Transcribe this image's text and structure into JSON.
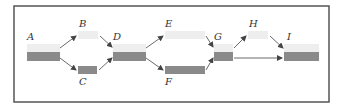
{
  "diagram": {
    "frame": {
      "x": 14,
      "y": 6,
      "w": 315,
      "h": 96,
      "stroke": "#555555"
    },
    "colors": {
      "light": "#eeeeee",
      "dark": "#8a8a8a",
      "arrow": "#444444"
    },
    "nodes": [
      {
        "id": "A",
        "label": "A",
        "x": 27,
        "w": 33,
        "level": "mid",
        "light": true,
        "dark": true,
        "lx": 27,
        "ly": 40
      },
      {
        "id": "B",
        "label": "B",
        "x": 78,
        "w": 20,
        "level": "top",
        "light": true,
        "dark": false,
        "lx": 79,
        "ly": 27
      },
      {
        "id": "C",
        "label": "C",
        "x": 78,
        "w": 19,
        "level": "bottom",
        "light": false,
        "dark": true,
        "lx": 79,
        "ly": 85
      },
      {
        "id": "D",
        "label": "D",
        "x": 113,
        "w": 33,
        "level": "mid",
        "light": true,
        "dark": true,
        "lx": 113,
        "ly": 40
      },
      {
        "id": "E",
        "label": "E",
        "x": 165,
        "w": 40,
        "level": "top",
        "light": true,
        "dark": false,
        "lx": 165,
        "ly": 27
      },
      {
        "id": "F",
        "label": "F",
        "x": 165,
        "w": 40,
        "level": "bottom",
        "light": false,
        "dark": true,
        "lx": 165,
        "ly": 85
      },
      {
        "id": "G",
        "label": "G",
        "x": 214,
        "w": 19,
        "level": "mid",
        "light": true,
        "dark": true,
        "lx": 214,
        "ly": 40
      },
      {
        "id": "H",
        "label": "H",
        "x": 248,
        "w": 20,
        "level": "top",
        "light": true,
        "dark": false,
        "lx": 249,
        "ly": 27
      },
      {
        "id": "I",
        "label": "I",
        "x": 284,
        "w": 35,
        "level": "mid",
        "light": true,
        "dark": true,
        "lx": 287,
        "ly": 40
      }
    ],
    "edges": [
      {
        "from": "A",
        "to": "B",
        "x1": 60,
        "y1": 48,
        "x2": 76,
        "y2": 36
      },
      {
        "from": "A",
        "to": "C",
        "x1": 60,
        "y1": 58,
        "x2": 76,
        "y2": 70
      },
      {
        "from": "B",
        "to": "D",
        "x1": 100,
        "y1": 36,
        "x2": 112,
        "y2": 47
      },
      {
        "from": "C",
        "to": "D",
        "x1": 99,
        "y1": 70,
        "x2": 112,
        "y2": 58
      },
      {
        "from": "D",
        "to": "E",
        "x1": 146,
        "y1": 48,
        "x2": 163,
        "y2": 36
      },
      {
        "from": "D",
        "to": "F",
        "x1": 146,
        "y1": 58,
        "x2": 163,
        "y2": 70
      },
      {
        "from": "E",
        "to": "G",
        "x1": 206,
        "y1": 36,
        "x2": 213,
        "y2": 47
      },
      {
        "from": "F",
        "to": "G",
        "x1": 206,
        "y1": 70,
        "x2": 213,
        "y2": 58
      },
      {
        "from": "G",
        "to": "H",
        "x1": 234,
        "y1": 48,
        "x2": 246,
        "y2": 36
      },
      {
        "from": "H",
        "to": "I",
        "x1": 270,
        "y1": 36,
        "x2": 283,
        "y2": 48
      },
      {
        "from": "G",
        "to": "I",
        "x1": 234,
        "y1": 58,
        "x2": 282,
        "y2": 58
      }
    ]
  }
}
